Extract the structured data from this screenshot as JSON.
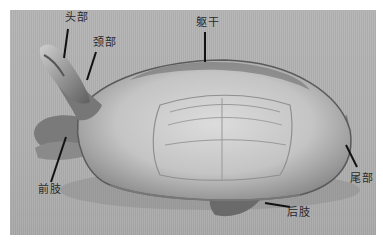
{
  "figure": {
    "labels": {
      "head": "头部",
      "neck": "颈部",
      "trunk": "躯干",
      "tail": "尾部",
      "forelimb": "前肢",
      "hindlimb": "后肢"
    },
    "colors": {
      "background": "#b2b2b2",
      "shell_light": "#d4d4d4",
      "shell_dark": "#6e6e6e",
      "leader_line": "#111111",
      "label_text": "#2a2a2a"
    }
  }
}
